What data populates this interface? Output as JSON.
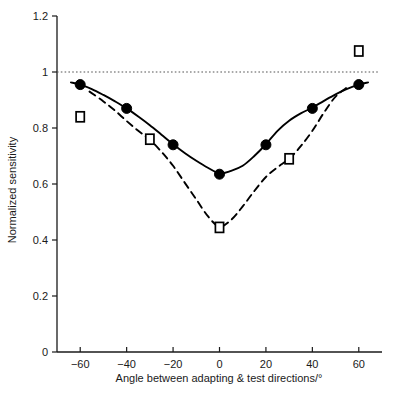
{
  "chart_data": {
    "type": "scatter",
    "title": "",
    "subtitle": "",
    "xlabel": "Angle between adapting & test directions/°",
    "ylabel": "Normalized sensitivity",
    "xlim": [
      -70,
      70
    ],
    "ylim": [
      0,
      1.2
    ],
    "xticks": [
      -60,
      -40,
      -20,
      0,
      20,
      40,
      60
    ],
    "xtick_labels": [
      "−60",
      "−40",
      "−20",
      "0",
      "20",
      "40",
      "60"
    ],
    "yticks": [
      0,
      0.2,
      0.4,
      0.6,
      0.8,
      1,
      1.2
    ],
    "ytick_labels": [
      "0",
      "0.2",
      "0.4",
      "0.6",
      "0.8",
      "1",
      "1.2"
    ],
    "grid": false,
    "legend_position": "none",
    "annotations": [
      {
        "kind": "reference-line",
        "name": "unity-reference-line",
        "y": 1.0,
        "style": "dotted",
        "color": "#555555"
      }
    ],
    "series": [
      {
        "name": "filled-circles",
        "marker": "filled-circle",
        "line": "solid",
        "color": "#000000",
        "x": [
          -60,
          -40,
          -20,
          0,
          20,
          40,
          60
        ],
        "values": [
          0.955,
          0.87,
          0.74,
          0.635,
          0.74,
          0.87,
          0.955
        ],
        "fit_curve": {
          "style": "solid",
          "points_x": [
            -64,
            -60,
            -55,
            -50,
            -45,
            -40,
            -35,
            -30,
            -25,
            -20,
            -15,
            -10,
            -5,
            0,
            5,
            10,
            15,
            20,
            25,
            30,
            35,
            40,
            45,
            50,
            55,
            60,
            64
          ],
          "points_y": [
            0.963,
            0.955,
            0.939,
            0.918,
            0.895,
            0.87,
            0.841,
            0.81,
            0.776,
            0.742,
            0.711,
            0.683,
            0.658,
            0.638,
            0.647,
            0.665,
            0.7,
            0.742,
            0.79,
            0.826,
            0.852,
            0.873,
            0.897,
            0.92,
            0.94,
            0.955,
            0.963
          ]
        }
      },
      {
        "name": "open-squares",
        "marker": "open-square",
        "line": "dashed",
        "color": "#000000",
        "x": [
          -60,
          -30,
          0,
          30,
          60
        ],
        "values": [
          0.84,
          0.76,
          0.445,
          0.69,
          1.075
        ],
        "fit_curve": {
          "style": "dashed",
          "points_x": [
            -56,
            -50,
            -45,
            -40,
            -35,
            -30,
            -25,
            -20,
            -15,
            -10,
            -5,
            0,
            5,
            10,
            15,
            20,
            25,
            30,
            35,
            40,
            45,
            50,
            55
          ],
          "points_y": [
            0.93,
            0.895,
            0.862,
            0.825,
            0.79,
            0.758,
            0.715,
            0.665,
            0.605,
            0.545,
            0.485,
            0.448,
            0.472,
            0.52,
            0.575,
            0.625,
            0.66,
            0.69,
            0.735,
            0.79,
            0.855,
            0.912,
            0.945
          ]
        }
      }
    ]
  },
  "axes": {
    "y_axis_name": "y-axis",
    "x_axis_name": "x-axis"
  }
}
